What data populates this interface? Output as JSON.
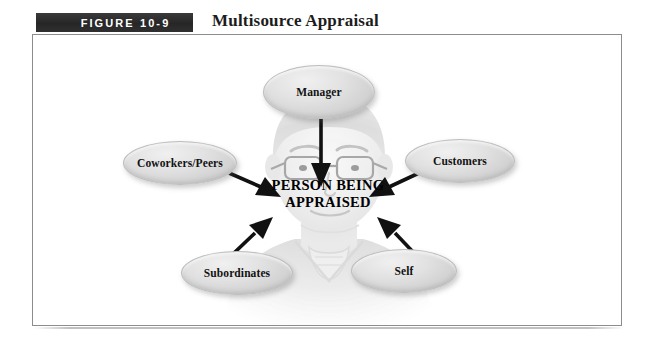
{
  "figure": {
    "tag": "FIGURE  10-9",
    "title": "Multisource Appraisal"
  },
  "center": {
    "line1": "PERSON BEING",
    "line2": "APPRAISED"
  },
  "nodes": [
    {
      "id": "manager",
      "label": "Manager"
    },
    {
      "id": "coworkers",
      "label": "Coworkers/Peers"
    },
    {
      "id": "customers",
      "label": "Customers"
    },
    {
      "id": "subordinates",
      "label": "Subordinates"
    },
    {
      "id": "self",
      "label": "Self"
    }
  ],
  "arrows": [
    {
      "from": "manager",
      "to": "center",
      "direction": "down"
    },
    {
      "from": "coworkers",
      "to": "center",
      "direction": "down-right"
    },
    {
      "from": "customers",
      "to": "center",
      "direction": "down-left"
    },
    {
      "from": "subordinates",
      "to": "center",
      "direction": "up-right"
    },
    {
      "from": "self",
      "to": "center",
      "direction": "up-left"
    }
  ],
  "colors": {
    "tag_background": "#2b2b2b",
    "tag_text": "#ffffff",
    "frame_border": "#8d8d8d",
    "node_fill": "#dcdcdc",
    "arrow": "#111111",
    "page_background": "#ffffff"
  },
  "graphic": {
    "background_image": "faint-grayscale-portrait-of-person-with-glasses"
  }
}
